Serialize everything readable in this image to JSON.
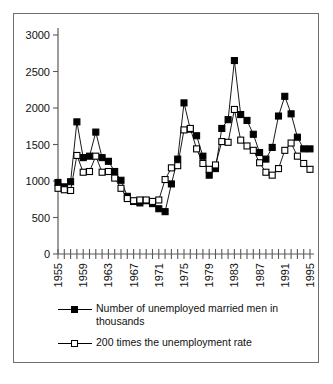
{
  "chart_data": {
    "type": "line",
    "title": "",
    "subtitle": "",
    "xlabel": "",
    "ylabel": "",
    "ylim": [
      0,
      3000
    ],
    "xlim": [
      1955,
      1995
    ],
    "ytick_values": [
      0,
      500,
      1000,
      1500,
      2000,
      2500,
      3000
    ],
    "ytick_labels": [
      "0",
      "500",
      "1000",
      "1500",
      "2000",
      "2500",
      "3000"
    ],
    "xtick_labels": [
      "1955",
      "1959",
      "1963",
      "1967",
      "1971",
      "1975",
      "1979",
      "1983",
      "1987",
      "1991",
      "1995"
    ],
    "xtick_label_rotation": 90,
    "xtick_every_year": true,
    "grid": false,
    "legend_position": "below",
    "x": [
      1955,
      1956,
      1957,
      1958,
      1959,
      1960,
      1961,
      1962,
      1963,
      1964,
      1965,
      1966,
      1967,
      1968,
      1969,
      1970,
      1971,
      1972,
      1973,
      1974,
      1975,
      1976,
      1977,
      1978,
      1979,
      1980,
      1981,
      1982,
      1983,
      1984,
      1985,
      1986,
      1987,
      1988,
      1989,
      1990,
      1991,
      1992,
      1993,
      1994,
      1995
    ],
    "series": [
      {
        "name": "Number of unemployed married men in thousands",
        "marker": "filled-square",
        "color": "#000000",
        "values": [
          980,
          920,
          990,
          1810,
          1320,
          1340,
          1670,
          1320,
          1270,
          1130,
          1010,
          790,
          720,
          700,
          730,
          690,
          620,
          580,
          960,
          1300,
          2070,
          1710,
          1620,
          1340,
          1080,
          1170,
          1720,
          1840,
          2650,
          1910,
          1830,
          1640,
          1390,
          1300,
          1460,
          1890,
          2160,
          1920,
          1600,
          1440,
          1440
        ]
      },
      {
        "name": "200 times the unemployment rate",
        "marker": "open-square",
        "color": "#000000",
        "values": [
          900,
          880,
          870,
          1350,
          1120,
          1130,
          1340,
          1120,
          1130,
          1040,
          900,
          760,
          730,
          740,
          740,
          720,
          740,
          1020,
          1180,
          1210,
          1700,
          1720,
          1440,
          1240,
          1160,
          1220,
          1540,
          1530,
          1980,
          1560,
          1480,
          1420,
          1250,
          1120,
          1080,
          1170,
          1420,
          1520,
          1340,
          1240,
          1160
        ]
      }
    ],
    "annotations": []
  },
  "legend": {
    "entries": [
      {
        "label": "Number of unemployed married men in thousands",
        "marker": "filled-square"
      },
      {
        "label": "200 times the unemployment rate",
        "marker": "open-square"
      }
    ]
  }
}
